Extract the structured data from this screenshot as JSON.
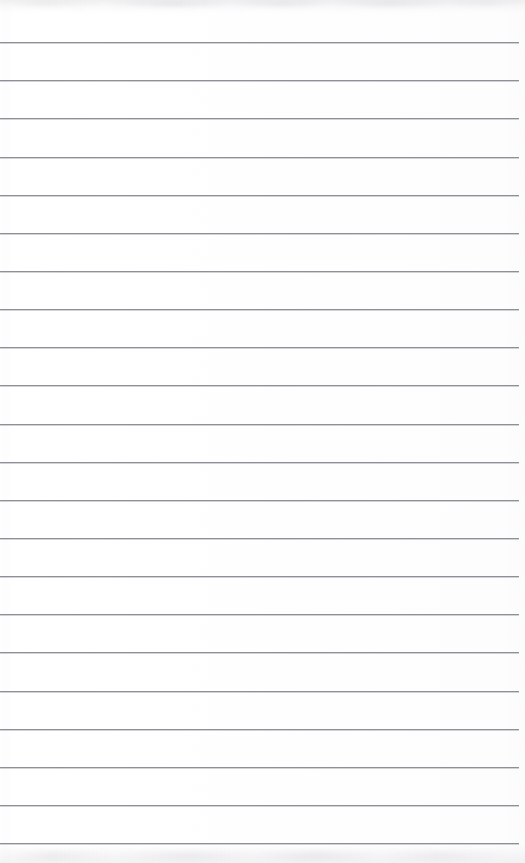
{
  "document": {
    "kind": "scanned-ruled-notepad-page",
    "title": "Blank ruled paper",
    "page_width": 525,
    "page_height": 863,
    "content_text": "",
    "handwriting_present": false,
    "printed_text_present": false
  },
  "paper": {
    "background_color": "#fefefe",
    "surface_tone_left": "#fbfbfc",
    "surface_tone_center": "#ffffff",
    "description": "near-white scanned paper with faint grain"
  },
  "ruling": {
    "line_color": "#8e9096",
    "line_thickness_px": 1,
    "line_count": 22,
    "first_line_y": 42,
    "line_spacing_px": 38.3,
    "left_inset_px": 0,
    "right_inset_px": 6,
    "orientation": "horizontal",
    "margin_rule_present": false,
    "line_y_positions": [
      42,
      80,
      118,
      157,
      195,
      233,
      271,
      309,
      347,
      385,
      424,
      462,
      500,
      538,
      576,
      614,
      652,
      691,
      729,
      767,
      805,
      843
    ]
  },
  "artifacts": {
    "top_shadow_color": "#9a9ca2",
    "top_shadow_height_px": 14,
    "bottom_shadow_color": "#9b9da3",
    "bottom_shadow_height_px": 20,
    "left_gutter_highlight": "#ffffff"
  }
}
